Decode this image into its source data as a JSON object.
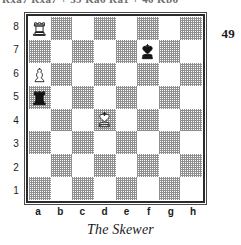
{
  "page": {
    "page_number": "49",
    "clipped_header_text": "Rxa7 Rxa7 + 39 Ka6 Ra1 + 40 Kb6",
    "caption": "The Skewer"
  },
  "diagram": {
    "name": "chess-position-diagram",
    "rank_labels": [
      "8",
      "7",
      "6",
      "5",
      "4",
      "3",
      "2",
      "1"
    ],
    "file_labels": [
      "a",
      "b",
      "c",
      "d",
      "e",
      "f",
      "g",
      "h"
    ],
    "colors": {
      "light_square": "#ffffff",
      "dark_square": "#8f8f8f",
      "border": "#2b2b2b",
      "text": "#1a1a1a"
    },
    "squares": [
      {
        "square": "a8",
        "shade": "light",
        "piece": "white-rook"
      },
      {
        "square": "b8",
        "shade": "dark",
        "piece": null
      },
      {
        "square": "c8",
        "shade": "light",
        "piece": null
      },
      {
        "square": "d8",
        "shade": "dark",
        "piece": null
      },
      {
        "square": "e8",
        "shade": "light",
        "piece": null
      },
      {
        "square": "f8",
        "shade": "dark",
        "piece": null
      },
      {
        "square": "g8",
        "shade": "light",
        "piece": null
      },
      {
        "square": "h8",
        "shade": "dark",
        "piece": null
      },
      {
        "square": "a7",
        "shade": "dark",
        "piece": null
      },
      {
        "square": "b7",
        "shade": "light",
        "piece": null
      },
      {
        "square": "c7",
        "shade": "dark",
        "piece": null
      },
      {
        "square": "d7",
        "shade": "light",
        "piece": null
      },
      {
        "square": "e7",
        "shade": "dark",
        "piece": null
      },
      {
        "square": "f7",
        "shade": "light",
        "piece": "black-king"
      },
      {
        "square": "g7",
        "shade": "dark",
        "piece": null
      },
      {
        "square": "h7",
        "shade": "light",
        "piece": null
      },
      {
        "square": "a6",
        "shade": "light",
        "piece": "white-pawn"
      },
      {
        "square": "b6",
        "shade": "dark",
        "piece": null
      },
      {
        "square": "c6",
        "shade": "light",
        "piece": null
      },
      {
        "square": "d6",
        "shade": "dark",
        "piece": null
      },
      {
        "square": "e6",
        "shade": "light",
        "piece": null
      },
      {
        "square": "f6",
        "shade": "dark",
        "piece": null
      },
      {
        "square": "g6",
        "shade": "light",
        "piece": null
      },
      {
        "square": "h6",
        "shade": "dark",
        "piece": null
      },
      {
        "square": "a5",
        "shade": "dark",
        "piece": "black-rook"
      },
      {
        "square": "b5",
        "shade": "light",
        "piece": null
      },
      {
        "square": "c5",
        "shade": "dark",
        "piece": null
      },
      {
        "square": "d5",
        "shade": "light",
        "piece": null
      },
      {
        "square": "e5",
        "shade": "dark",
        "piece": null
      },
      {
        "square": "f5",
        "shade": "light",
        "piece": null
      },
      {
        "square": "g5",
        "shade": "dark",
        "piece": null
      },
      {
        "square": "h5",
        "shade": "light",
        "piece": null
      },
      {
        "square": "a4",
        "shade": "light",
        "piece": null
      },
      {
        "square": "b4",
        "shade": "dark",
        "piece": null
      },
      {
        "square": "c4",
        "shade": "light",
        "piece": null
      },
      {
        "square": "d4",
        "shade": "dark",
        "piece": "white-king"
      },
      {
        "square": "e4",
        "shade": "light",
        "piece": null
      },
      {
        "square": "f4",
        "shade": "dark",
        "piece": null
      },
      {
        "square": "g4",
        "shade": "light",
        "piece": null
      },
      {
        "square": "h4",
        "shade": "dark",
        "piece": null
      },
      {
        "square": "a3",
        "shade": "dark",
        "piece": null
      },
      {
        "square": "b3",
        "shade": "light",
        "piece": null
      },
      {
        "square": "c3",
        "shade": "dark",
        "piece": null
      },
      {
        "square": "d3",
        "shade": "light",
        "piece": null
      },
      {
        "square": "e3",
        "shade": "dark",
        "piece": null
      },
      {
        "square": "f3",
        "shade": "light",
        "piece": null
      },
      {
        "square": "g3",
        "shade": "dark",
        "piece": null
      },
      {
        "square": "h3",
        "shade": "light",
        "piece": null
      },
      {
        "square": "a2",
        "shade": "light",
        "piece": null
      },
      {
        "square": "b2",
        "shade": "dark",
        "piece": null
      },
      {
        "square": "c2",
        "shade": "light",
        "piece": null
      },
      {
        "square": "d2",
        "shade": "dark",
        "piece": null
      },
      {
        "square": "e2",
        "shade": "light",
        "piece": null
      },
      {
        "square": "f2",
        "shade": "dark",
        "piece": null
      },
      {
        "square": "g2",
        "shade": "light",
        "piece": null
      },
      {
        "square": "h2",
        "shade": "dark",
        "piece": null
      },
      {
        "square": "a1",
        "shade": "dark",
        "piece": null
      },
      {
        "square": "b1",
        "shade": "light",
        "piece": null
      },
      {
        "square": "c1",
        "shade": "dark",
        "piece": null
      },
      {
        "square": "d1",
        "shade": "light",
        "piece": null
      },
      {
        "square": "e1",
        "shade": "dark",
        "piece": null
      },
      {
        "square": "f1",
        "shade": "light",
        "piece": null
      },
      {
        "square": "g1",
        "shade": "dark",
        "piece": null
      },
      {
        "square": "h1",
        "shade": "light",
        "piece": null
      }
    ]
  }
}
